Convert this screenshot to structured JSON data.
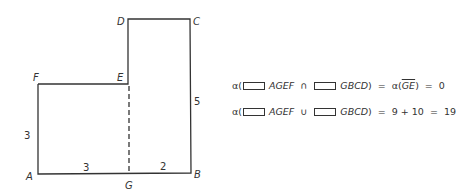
{
  "figure": {
    "vertices": {
      "A": {
        "label": "A",
        "x": 38,
        "y": 174
      },
      "G": {
        "label": "G",
        "x": 129,
        "y": 174
      },
      "B": {
        "label": "B",
        "x": 191,
        "y": 173
      },
      "C": {
        "label": "C",
        "x": 190,
        "y": 19
      },
      "D": {
        "label": "D",
        "x": 128,
        "y": 19
      },
      "E": {
        "label": "E",
        "x": 128,
        "y": 84
      },
      "F": {
        "label": "F",
        "x": 38,
        "y": 84
      }
    },
    "dimensions": {
      "AF": "3",
      "AG": "3",
      "GB": "2",
      "BC": "5"
    },
    "dashed_segment": "GE"
  },
  "equations": [
    {
      "measure": "α(",
      "set1": "AGEF",
      "op": "∩",
      "set2": "GBCD",
      "close": ")",
      "eq1": "=",
      "rhs_prefix": "α(",
      "rhs_seg": "GE",
      "rhs_close": ")",
      "eq2": "=",
      "result": "0"
    },
    {
      "measure": "α(",
      "set1": "AGEF",
      "op": "∪",
      "set2": "GBCD",
      "close": ")",
      "eq1": "=",
      "rhs": "9 + 10",
      "eq2": "=",
      "result": "19"
    }
  ]
}
